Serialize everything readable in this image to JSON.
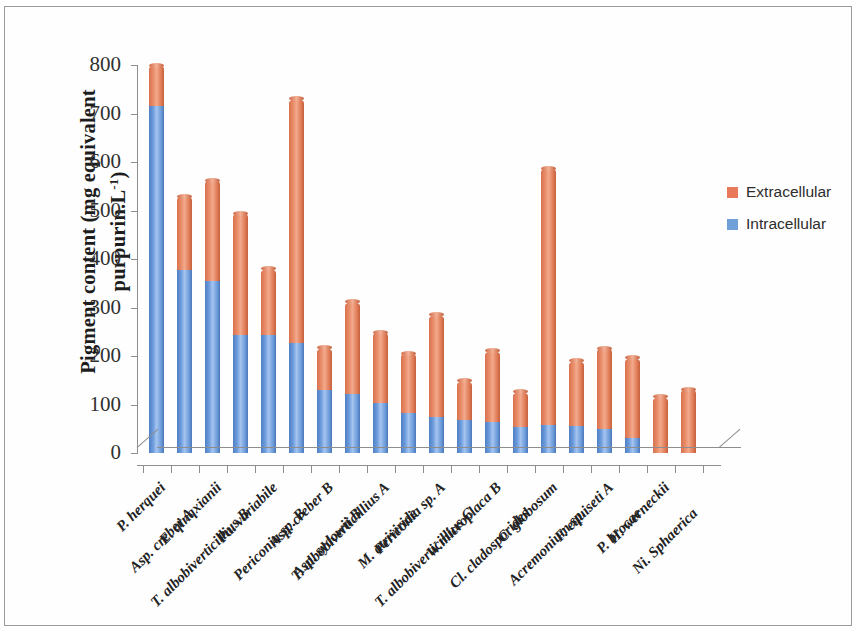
{
  "chart_data": {
    "type": "bar",
    "subtype": "stacked-column-3d",
    "title": "",
    "xlabel": "",
    "ylabel": "Pigment content (mg equivalent purpurin.L-1)",
    "ylabel_parts": {
      "line1": "Pigment content  (mg equivalent",
      "line2": "purpurin.L",
      "superscript": "-1",
      "line2_suffix": ")"
    },
    "ylim": [
      0,
      800
    ],
    "yticks": [
      0,
      100,
      200,
      300,
      400,
      500,
      600,
      700,
      800
    ],
    "grid": false,
    "legend_position": "right",
    "categories": [
      "P. herquei",
      "Asp. creber A",
      "E. qinqxianii",
      "T. albobiverticillius B",
      "Pa. variabile",
      "Periconia sp. B",
      "Asp. creber B",
      "Asp. sydowii B",
      "T. albobiverticillius A",
      "M. atriviride",
      "Periconia sp. A",
      "T. albobiverticillius C",
      "W.microplaca B",
      "Cl. cladosporides",
      "C. globosum",
      "Acremonium sp.",
      "F. equiseti A",
      "P. brocae",
      "H. werneckii",
      "Ni. Sphaerica"
    ],
    "series": [
      {
        "name": "Intracellular",
        "color": "#6fa0d8",
        "values": [
          715,
          377,
          355,
          243,
          243,
          226,
          130,
          122,
          103,
          82,
          74,
          69,
          64,
          54,
          58,
          55,
          50,
          30,
          0,
          0
        ]
      },
      {
        "name": "Extracellular",
        "color": "#e8795a",
        "values": [
          85,
          152,
          207,
          251,
          137,
          504,
          87,
          190,
          146,
          124,
          211,
          80,
          147,
          72,
          529,
          135,
          166,
          166,
          116,
          131
        ]
      }
    ],
    "totals": [
      800,
      529,
      562,
      494,
      380,
      730,
      217,
      312,
      249,
      206,
      285,
      149,
      211,
      126,
      587,
      190,
      216,
      196,
      116,
      131
    ]
  },
  "legend": {
    "items": [
      {
        "label": "Extracellular",
        "color": "#e8795a"
      },
      {
        "label": "Intracellular",
        "color": "#6fa0d8"
      }
    ]
  }
}
